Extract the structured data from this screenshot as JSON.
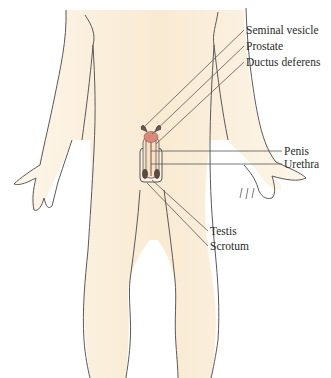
{
  "diagram": {
    "colors": {
      "skin": "#fbf1e0",
      "skin_shade": "#f3dcb8",
      "outline": "#5a5a5a",
      "prostate": "#d98a7a",
      "leader_line": "#555555",
      "label_text": "#2a2a2a"
    },
    "labels": [
      {
        "id": "seminal-vesicle",
        "text": "Seminal vesicle",
        "x": 246,
        "y": 24
      },
      {
        "id": "prostate",
        "text": "Prostate",
        "x": 246,
        "y": 40
      },
      {
        "id": "ductus-deferens",
        "text": "Ductus deferens",
        "x": 246,
        "y": 56
      },
      {
        "id": "penis",
        "text": "Penis",
        "x": 284,
        "y": 145
      },
      {
        "id": "urethra",
        "text": "Urethra",
        "x": 284,
        "y": 158
      },
      {
        "id": "testis",
        "text": "Testis",
        "x": 210,
        "y": 225
      },
      {
        "id": "scrotum",
        "text": "Scrotum",
        "x": 210,
        "y": 240
      }
    ]
  }
}
